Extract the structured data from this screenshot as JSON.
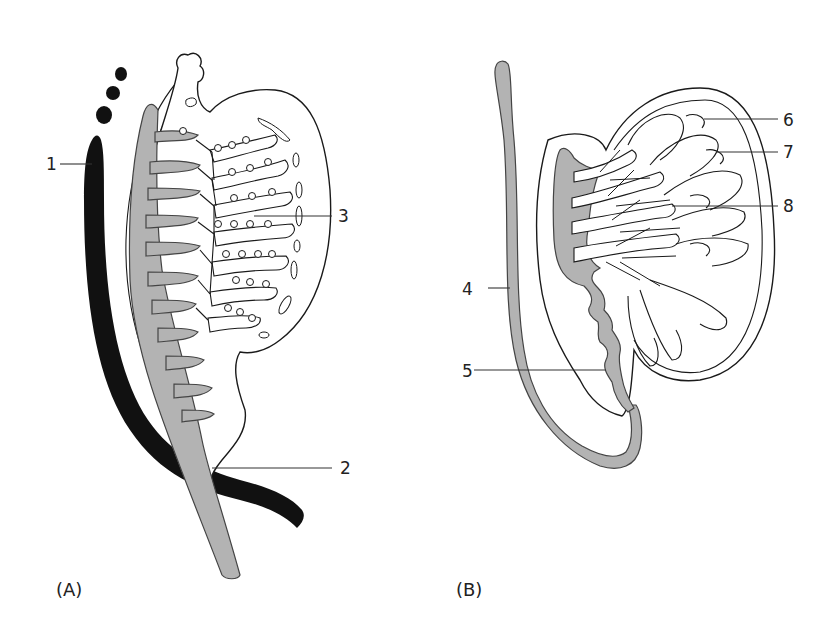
{
  "figure": {
    "panels": [
      {
        "id": "A",
        "caption": "(A)"
      },
      {
        "id": "B",
        "caption": "(B)"
      }
    ],
    "labels": [
      {
        "num": "1",
        "panel": "A"
      },
      {
        "num": "2",
        "panel": "A"
      },
      {
        "num": "3",
        "panel": "A"
      },
      {
        "num": "4",
        "panel": "B"
      },
      {
        "num": "5",
        "panel": "B"
      },
      {
        "num": "6",
        "panel": "B"
      },
      {
        "num": "7",
        "panel": "B"
      },
      {
        "num": "8",
        "panel": "B"
      }
    ],
    "colors": {
      "duct_fill": "#b3b3b3",
      "dark_structure": "#111111",
      "outline": "#1a1a1a",
      "background": "#ffffff"
    }
  }
}
